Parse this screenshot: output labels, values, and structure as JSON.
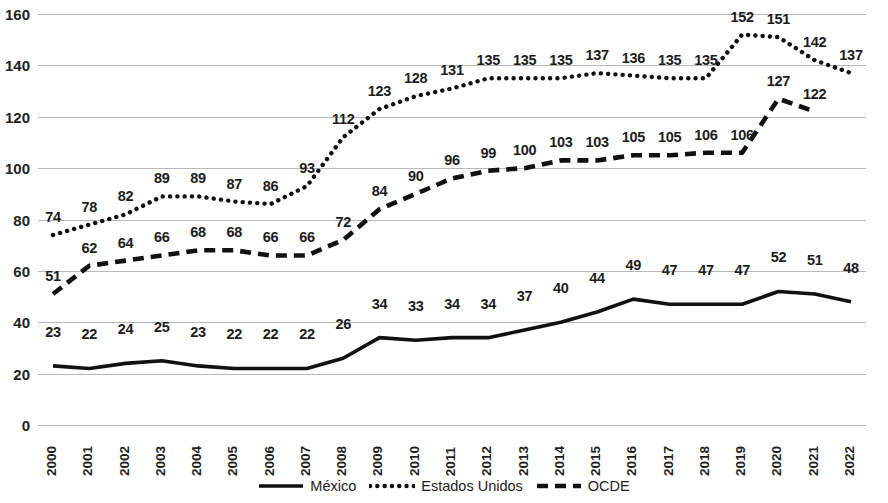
{
  "chart_data": {
    "type": "line",
    "title": "",
    "xlabel": "",
    "ylabel": "",
    "ylim": [
      0,
      160
    ],
    "ytick_step": 20,
    "grid": true,
    "legend_position": "bottom",
    "categories": [
      "2000",
      "2001",
      "2002",
      "2003",
      "2004",
      "2005",
      "2006",
      "2007",
      "2008",
      "2009",
      "2010",
      "2011",
      "2012",
      "2013",
      "2014",
      "2015",
      "2016",
      "2017",
      "2018",
      "2019",
      "2020",
      "2021",
      "2022"
    ],
    "yticks": [
      "0",
      "20",
      "40",
      "60",
      "80",
      "100",
      "120",
      "140",
      "160"
    ],
    "series": [
      {
        "name": "México",
        "style": "solid",
        "color": "#111111",
        "values": [
          23,
          22,
          24,
          25,
          23,
          22,
          22,
          22,
          26,
          34,
          33,
          34,
          34,
          37,
          40,
          44,
          49,
          47,
          47,
          47,
          52,
          51,
          48
        ],
        "labels": [
          "23",
          "22",
          "24",
          "25",
          "23",
          "22",
          "22",
          "22",
          "26",
          "34",
          "33",
          "34",
          "34",
          "37",
          "40",
          "44",
          "49",
          "47",
          "47",
          "47",
          "52",
          "51",
          "48"
        ]
      },
      {
        "name": "Estados Unidos",
        "style": "dotted",
        "color": "#111111",
        "values": [
          74,
          78,
          82,
          89,
          89,
          87,
          86,
          93,
          112,
          123,
          128,
          131,
          135,
          135,
          135,
          137,
          136,
          135,
          135,
          152,
          151,
          142,
          137
        ],
        "labels": [
          "74",
          "78",
          "82",
          "89",
          "89",
          "87",
          "86",
          "93",
          "112",
          "123",
          "128",
          "131",
          "135",
          "135",
          "135",
          "137",
          "136",
          "135",
          "135",
          "152",
          "151",
          "142",
          "137"
        ]
      },
      {
        "name": "OCDE",
        "style": "dashed",
        "color": "#111111",
        "values": [
          51,
          62,
          64,
          66,
          68,
          68,
          66,
          66,
          72,
          84,
          90,
          96,
          99,
          100,
          103,
          103,
          105,
          105,
          106,
          106,
          127,
          122,
          null
        ],
        "labels": [
          "51",
          "62",
          "64",
          "66",
          "68",
          "68",
          "66",
          "66",
          "72",
          "84",
          "90",
          "96",
          "99",
          "100",
          "103",
          "103",
          "105",
          "105",
          "106",
          "106",
          "127",
          "122",
          ""
        ]
      }
    ]
  },
  "legend": {
    "items": [
      {
        "label": "México",
        "style": "solid"
      },
      {
        "label": "Estados Unidos",
        "style": "dotted"
      },
      {
        "label": "OCDE",
        "style": "dashed"
      }
    ]
  },
  "colors": {
    "gridline": "#b9b9b9",
    "series": "#111111",
    "text": "#1c1c1c",
    "background": "#ffffff"
  }
}
